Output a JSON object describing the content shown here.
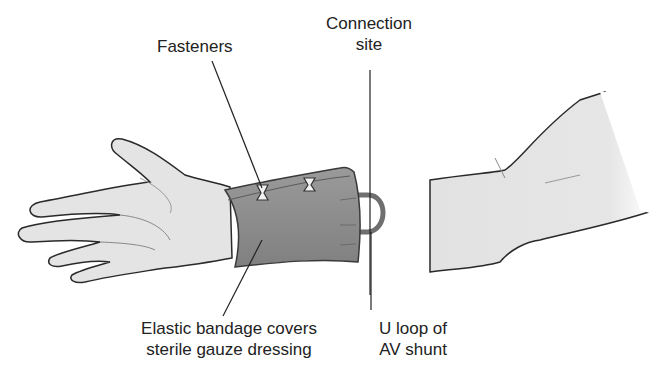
{
  "diagram": {
    "labels": {
      "fasteners": "Fasteners",
      "connection_site_line1": "Connection",
      "connection_site_line2": "site",
      "bandage_line1": "Elastic bandage covers",
      "bandage_line2": "sterile gauze dressing",
      "u_loop_line1": "U loop of",
      "u_loop_line2": "AV shunt"
    },
    "colors": {
      "skin": "#e4e4e4",
      "skin_shadow": "#cfcfcf",
      "bandage": "#8e8e8e",
      "bandage_dark": "#6f6f6f",
      "outline": "#2a2a2a",
      "leader_line": "#222222",
      "shunt_loop": "#7a7a7a"
    }
  }
}
